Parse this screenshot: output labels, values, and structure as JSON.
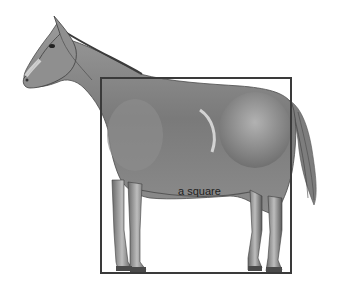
{
  "figure": {
    "overlay_shape": "square",
    "label": "a square",
    "colors": {
      "background": "#ffffff",
      "square_stroke": "#3a3a3a",
      "horse_dark": "#4a4a4a",
      "horse_mid": "#8a8a8a",
      "horse_light": "#d0d0d0"
    }
  }
}
